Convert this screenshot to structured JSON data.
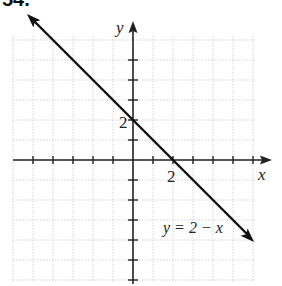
{
  "header": {
    "exercise_label": "54."
  },
  "chart_data": {
    "type": "line",
    "title": "",
    "equation_label": "y = 2 − x",
    "xlabel": "x",
    "ylabel": "y",
    "xlim": [
      -6,
      7
    ],
    "ylim": [
      -6,
      7
    ],
    "grid": true,
    "tick_labels": {
      "x": [
        "2"
      ],
      "y": [
        "2"
      ]
    },
    "series": [
      {
        "name": "y = 2 - x",
        "x": [
          -4,
          6
        ],
        "y": [
          6,
          -4
        ]
      }
    ],
    "intercepts": {
      "x_intercept": [
        2,
        0
      ],
      "y_intercept": [
        0,
        2
      ]
    },
    "colors": {
      "line": "#111111",
      "grid": "#c8c8c8",
      "axis": "#222222"
    }
  }
}
